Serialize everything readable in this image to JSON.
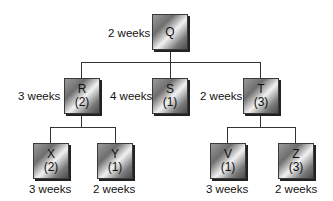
{
  "nodes": {
    "Q": {
      "name": "Q",
      "count": "",
      "duration": "2 weeks"
    },
    "R": {
      "name": "R",
      "count": "(2)",
      "duration": "3 weeks"
    },
    "S": {
      "name": "S",
      "count": "(1)",
      "duration": "4 weeks"
    },
    "T": {
      "name": "T",
      "count": "(3)",
      "duration": "2 weeks"
    },
    "X": {
      "name": "X",
      "count": "(2)",
      "duration": "3 weeks"
    },
    "Y": {
      "name": "Y",
      "count": "(1)",
      "duration": "2 weeks"
    },
    "V": {
      "name": "V",
      "count": "(1)",
      "duration": "3 weeks"
    },
    "Z": {
      "name": "Z",
      "count": "(3)",
      "duration": "2 weeks"
    }
  }
}
